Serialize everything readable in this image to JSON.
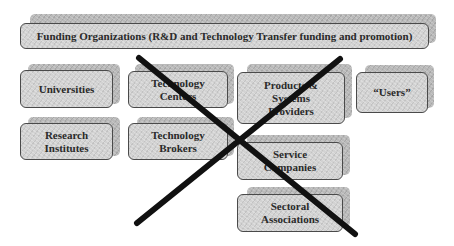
{
  "diagram": {
    "banner": {
      "label": "Funding Organizations (R&D and Technology Transfer funding and promotion)"
    },
    "nodes": [
      {
        "id": "universities",
        "label": "Universities"
      },
      {
        "id": "technology-centers",
        "label": "Technology\nCenters"
      },
      {
        "id": "products-systems-providers",
        "label": "Products &\nSystems\nProviders"
      },
      {
        "id": "users",
        "label": "“Users”"
      },
      {
        "id": "research-institutes",
        "label": "Research\nInstitutes"
      },
      {
        "id": "technology-brokers",
        "label": "Technology\nBrokers"
      },
      {
        "id": "service-companies",
        "label": "Service\nCompanies"
      },
      {
        "id": "sectoral-associations",
        "label": "Sectoral\nAssociations"
      }
    ],
    "cross_out": {
      "type": "X",
      "color": "#111111"
    }
  },
  "colors": {
    "box_fill": "#d2d2d2",
    "box_shadow": "#b9b9b9",
    "box_border": "#4a4a4a",
    "text": "#2a2a2a",
    "cross": "#111111"
  }
}
